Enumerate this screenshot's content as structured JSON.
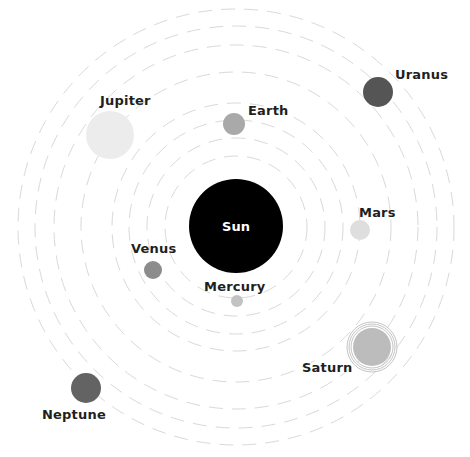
{
  "diagram": {
    "center": {
      "x": 236,
      "y": 227
    },
    "orbit_color": "#d9d9d9",
    "orbits": [
      {
        "name": "mercury-orbit",
        "r": 71
      },
      {
        "name": "venus-orbit",
        "r": 89
      },
      {
        "name": "earth-orbit",
        "r": 107
      },
      {
        "name": "mars-orbit",
        "r": 124
      },
      {
        "name": "jupiter-orbit",
        "r": 155
      },
      {
        "name": "saturn-orbit",
        "r": 182
      },
      {
        "name": "uranus-orbit",
        "r": 201
      },
      {
        "name": "neptune-orbit",
        "r": 218
      }
    ],
    "sun": {
      "label": "Sun",
      "x": 236,
      "y": 226,
      "r": 47,
      "color": "#000000"
    },
    "planets": [
      {
        "id": "mercury",
        "label": "Mercury",
        "x": 237,
        "y": 301,
        "r": 6,
        "color": "#c2c2c2",
        "label_x": 204,
        "label_y": 279
      },
      {
        "id": "venus",
        "label": "Venus",
        "x": 153,
        "y": 270,
        "r": 9,
        "color": "#8c8c8c",
        "label_x": 131,
        "label_y": 241
      },
      {
        "id": "earth",
        "label": "Earth",
        "x": 234,
        "y": 124,
        "r": 11,
        "color": "#a9a9a9",
        "label_x": 248,
        "label_y": 103
      },
      {
        "id": "mars",
        "label": "Mars",
        "x": 360,
        "y": 230,
        "r": 10,
        "color": "#dedede",
        "label_x": 359,
        "label_y": 205
      },
      {
        "id": "jupiter",
        "label": "Jupiter",
        "x": 110,
        "y": 135,
        "r": 24,
        "color": "#ececec",
        "label_x": 100,
        "label_y": 93
      },
      {
        "id": "saturn",
        "label": "Saturn",
        "x": 372,
        "y": 347,
        "r": 19,
        "color": "#bcbcbc",
        "label_x": 302,
        "label_y": 360,
        "rings": [
          21,
          23,
          25
        ]
      },
      {
        "id": "uranus",
        "label": "Uranus",
        "x": 378,
        "y": 92,
        "r": 15,
        "color": "#555555",
        "label_x": 395,
        "label_y": 67
      },
      {
        "id": "neptune",
        "label": "Neptune",
        "x": 86,
        "y": 388,
        "r": 15,
        "color": "#636363",
        "label_x": 42,
        "label_y": 407
      }
    ]
  }
}
